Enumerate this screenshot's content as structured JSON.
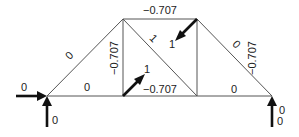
{
  "diagram": {
    "type": "truss-force-diagram",
    "nodes": [
      {
        "id": "A",
        "x": 47,
        "y": 96
      },
      {
        "id": "B",
        "x": 123,
        "y": 19
      },
      {
        "id": "C",
        "x": 197,
        "y": 19
      },
      {
        "id": "D",
        "x": 123,
        "y": 96
      },
      {
        "id": "E",
        "x": 197,
        "y": 96
      },
      {
        "id": "F",
        "x": 272,
        "y": 96
      }
    ],
    "members": [
      {
        "id": "AB",
        "label": "0"
      },
      {
        "id": "AD",
        "label": "0"
      },
      {
        "id": "BC",
        "label": "−0.707"
      },
      {
        "id": "BD",
        "label": "−0.707"
      },
      {
        "id": "BE",
        "label": "1"
      },
      {
        "id": "DE",
        "label": "−0.707"
      },
      {
        "id": "CE",
        "label": "−0.707"
      },
      {
        "id": "CF",
        "label": "0"
      },
      {
        "id": "EF",
        "label": "0"
      }
    ],
    "loads": [
      {
        "id": "load-D",
        "node": "D",
        "direction": "up-right",
        "label": "1"
      },
      {
        "id": "load-C",
        "node": "C",
        "direction": "down-left",
        "label": "1"
      }
    ],
    "reactions": [
      {
        "id": "reaction-A-horizontal",
        "node": "A",
        "label": "0"
      },
      {
        "id": "reaction-A-vertical",
        "node": "A",
        "label": "0"
      },
      {
        "id": "reaction-F-horizontal",
        "node": "F",
        "label": "0"
      },
      {
        "id": "reaction-F-vertical",
        "node": "F",
        "label": "0"
      }
    ]
  }
}
